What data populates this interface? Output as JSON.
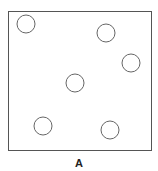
{
  "diagram": {
    "box": {
      "x": 8,
      "y": 11,
      "width": 143,
      "height": 139,
      "stroke": "#555555"
    },
    "circle_radius": 9,
    "circle_stroke": "#666666",
    "circles": [
      {
        "cx": 26,
        "cy": 24
      },
      {
        "cx": 106,
        "cy": 33
      },
      {
        "cx": 131,
        "cy": 63
      },
      {
        "cx": 75,
        "cy": 83
      },
      {
        "cx": 43,
        "cy": 126
      },
      {
        "cx": 110,
        "cy": 130
      }
    ],
    "label": "A"
  }
}
